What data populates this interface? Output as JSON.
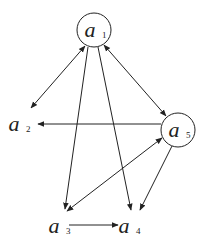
{
  "diagram": {
    "type": "directed-graph",
    "nodes": [
      {
        "id": "a1",
        "base": "a",
        "sub": "1",
        "circled": true
      },
      {
        "id": "a2",
        "base": "a",
        "sub": "2",
        "circled": false
      },
      {
        "id": "a3",
        "base": "a",
        "sub": "3",
        "circled": false
      },
      {
        "id": "a4",
        "base": "a",
        "sub": "4",
        "circled": false
      },
      {
        "id": "a5",
        "base": "a",
        "sub": "5",
        "circled": true
      }
    ],
    "edges": [
      {
        "from": "a1",
        "to": "a2",
        "bidirectional": true
      },
      {
        "from": "a1",
        "to": "a5",
        "bidirectional": true
      },
      {
        "from": "a1",
        "to": "a3",
        "bidirectional": false
      },
      {
        "from": "a1",
        "to": "a4",
        "bidirectional": false
      },
      {
        "from": "a5",
        "to": "a2",
        "bidirectional": false
      },
      {
        "from": "a5",
        "to": "a3",
        "bidirectional": true
      },
      {
        "from": "a5",
        "to": "a4",
        "bidirectional": false
      },
      {
        "from": "a3",
        "to": "a4",
        "bidirectional": false
      }
    ]
  }
}
